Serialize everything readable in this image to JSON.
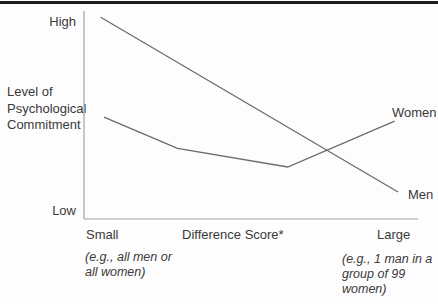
{
  "figure": {
    "y_axis": {
      "high_label": "High",
      "low_label": "Low",
      "title_lines": [
        "Level of",
        "Psychological",
        "Commitment"
      ]
    },
    "x_axis": {
      "left_label": "Small",
      "title": "Difference Score*",
      "right_label": "Large"
    },
    "annotations": {
      "left_lines": [
        "(e.g., all men or",
        "all women)"
      ],
      "right_lines": [
        "(e.g., 1 man in a",
        "group of 99",
        "women)"
      ]
    },
    "series_labels": {
      "women": "Women",
      "men": "Men"
    }
  },
  "colors": {
    "top_rule": "#1d1d1d",
    "axis": "#a3a3a3",
    "series_line": "#6b6b6b",
    "text": "#3a3a3a"
  },
  "chart_data": {
    "type": "line",
    "title": "",
    "xlabel": "Difference Score*",
    "ylabel": "Level of Psychological Commitment",
    "x_axis_endpoint_labels": [
      "Small",
      "Large"
    ],
    "y_axis_endpoint_labels": [
      "Low",
      "High"
    ],
    "x_endpoint_examples": [
      "(e.g., all men or all women)",
      "(e.g., 1 man in a group of 99 women)"
    ],
    "axis_numeric_scale": false,
    "normalization": "x: 0 = Small ... 1 = Large difference score; y: 0 = Low ... 1 = High commitment",
    "series": [
      {
        "name": "Women",
        "points": [
          [
            0.06,
            0.49
          ],
          [
            0.28,
            0.34
          ],
          [
            0.61,
            0.25
          ],
          [
            0.93,
            0.47
          ]
        ]
      },
      {
        "name": "Men",
        "points": [
          [
            0.05,
            0.97
          ],
          [
            0.94,
            0.13
          ]
        ]
      }
    ],
    "legend_position": "inline-right-of-lines",
    "grid": false
  }
}
